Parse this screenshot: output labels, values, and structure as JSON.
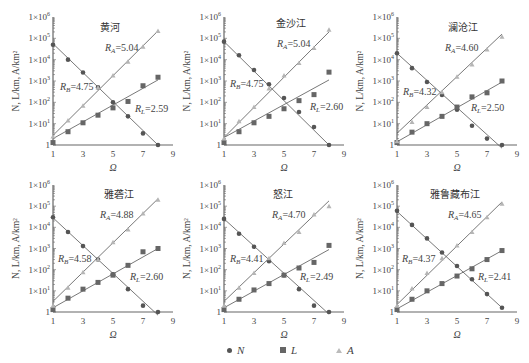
{
  "chart_data": [
    {
      "type": "scatter",
      "title": "黄河",
      "xlabel": "Ω",
      "ylabel": "N, L/km, A/km²",
      "x_ticks": [
        "1",
        "3",
        "5",
        "7",
        "9"
      ],
      "y_ticks": [
        "1",
        "1×10¹",
        "1×10²",
        "1×10³",
        "1×10⁴",
        "1×10⁵",
        "1×10⁶"
      ],
      "xlim": [
        1,
        9
      ],
      "ylim": [
        1,
        1000000
      ],
      "yscale": "log",
      "x": [
        1,
        2,
        3,
        4,
        5,
        6,
        7,
        8
      ],
      "series": [
        {
          "name": "N",
          "marker": "circle",
          "values": [
            50000,
            10000,
            2500,
            500,
            100,
            22,
            3.5,
            1
          ]
        },
        {
          "name": "L",
          "marker": "square",
          "values": [
            1.3,
            4.2,
            11,
            25,
            55,
            110,
            600,
            1500
          ]
        },
        {
          "name": "A",
          "marker": "triangle",
          "values": [
            2.5,
            14,
            70,
            500,
            1800,
            8000,
            40000,
            220000
          ]
        }
      ],
      "annotations": [
        {
          "text": "R_A=5.04",
          "sym": "A",
          "val": "=5.04"
        },
        {
          "text": "R_B=4.75",
          "sym": "B",
          "val": "=4.75"
        },
        {
          "text": "R_L=2.59",
          "sym": "L",
          "val": "=2.59"
        }
      ],
      "fits": {
        "N": [
          4.75,
          0.0
        ],
        "L": [
          0.3,
          3.05
        ],
        "A": [
          0.45,
          5.35
        ]
      },
      "labelpos": {
        "title": [
          100,
          31
        ],
        "RA": [
          105,
          51
        ],
        "RB": [
          60,
          90
        ],
        "RL": [
          135,
          112
        ]
      }
    },
    {
      "type": "scatter",
      "title": "金沙江",
      "xlabel": "Ω",
      "ylabel": "N, L/km, A/km²",
      "x_ticks": [
        "1",
        "3",
        "5",
        "7",
        "9"
      ],
      "y_ticks": [
        "1",
        "1×10¹",
        "1×10²",
        "1×10³",
        "1×10⁴",
        "1×10⁵",
        "1×10⁶"
      ],
      "xlim": [
        1,
        9
      ],
      "ylim": [
        1,
        1000000
      ],
      "yscale": "log",
      "x": [
        1,
        2,
        3,
        4,
        5,
        6,
        7,
        8
      ],
      "series": [
        {
          "name": "N",
          "marker": "circle",
          "values": [
            70000,
            16000,
            3300,
            700,
            160,
            35,
            7,
            1
          ]
        },
        {
          "name": "L",
          "marker": "square",
          "values": [
            1.3,
            4.2,
            11,
            22,
            50,
            120,
            230,
            2600
          ]
        },
        {
          "name": "A",
          "marker": "triangle",
          "values": [
            2,
            13,
            60,
            450,
            1800,
            7000,
            35000,
            250000
          ]
        }
      ],
      "annotations": [
        {
          "text": "R_A=5.04",
          "sym": "A",
          "val": "=5.04"
        },
        {
          "text": "R_B=4.75",
          "sym": "B",
          "val": "=4.75"
        },
        {
          "text": "R_L=2.60",
          "sym": "L",
          "val": "=2.60"
        }
      ],
      "fits": {
        "N": [
          4.85,
          0.0
        ],
        "L": [
          0.35,
          3.05
        ],
        "A": [
          0.35,
          5.3
        ]
      },
      "labelpos": {
        "title": [
          276,
          27
        ],
        "RA": [
          277,
          47
        ],
        "RB": [
          230,
          87
        ],
        "RL": [
          310,
          110
        ]
      }
    },
    {
      "type": "scatter",
      "title": "澜沧江",
      "xlabel": "Ω",
      "ylabel": "N, L/km, A/km²",
      "x_ticks": [
        "1",
        "3",
        "5",
        "7",
        "9"
      ],
      "y_ticks": [
        "1",
        "1×10¹",
        "1×10²",
        "1×10³",
        "1×10⁴",
        "1×10⁵",
        "1×10⁶"
      ],
      "xlim": [
        1,
        9
      ],
      "ylim": [
        1,
        1000000
      ],
      "yscale": "log",
      "x": [
        1,
        2,
        3,
        4,
        5,
        6,
        7,
        8
      ],
      "series": [
        {
          "name": "N",
          "marker": "circle",
          "values": [
            20000,
            4000,
            900,
            220,
            45,
            8,
            2,
            1
          ]
        },
        {
          "name": "L",
          "marker": "square",
          "values": [
            1.3,
            4,
            10,
            22,
            60,
            180,
            280,
            1000
          ]
        },
        {
          "name": "A",
          "marker": "triangle",
          "values": [
            1.5,
            12,
            60,
            300,
            1600,
            6000,
            30000,
            120000
          ]
        }
      ],
      "annotations": [
        {
          "text": "R_A=4.60",
          "sym": "A",
          "val": "=4.60"
        },
        {
          "text": "R_B=4.32",
          "sym": "B",
          "val": "=4.32"
        },
        {
          "text": "R_L=2.50",
          "sym": "L",
          "val": "=2.50"
        }
      ],
      "fits": {
        "N": [
          4.3,
          -0.15
        ],
        "L": [
          0.15,
          2.95
        ],
        "A": [
          0.55,
          5.2
        ]
      },
      "labelpos": {
        "title": [
          448,
          31
        ],
        "RA": [
          445,
          51
        ],
        "RB": [
          403,
          95
        ],
        "RL": [
          471,
          111
        ]
      }
    },
    {
      "type": "scatter",
      "title": "雅砻江",
      "xlabel": "Ω",
      "ylabel": "N, L/km, A/km²",
      "x_ticks": [
        "1",
        "3",
        "5",
        "7",
        "9"
      ],
      "y_ticks": [
        "1",
        "1×10¹",
        "1×10²",
        "1×10³",
        "1×10⁴",
        "1×10⁵",
        "1×10⁶"
      ],
      "xlim": [
        1,
        9
      ],
      "ylim": [
        1,
        1000000
      ],
      "yscale": "log",
      "x": [
        1,
        2,
        3,
        4,
        5,
        6,
        7,
        8
      ],
      "series": [
        {
          "name": "N",
          "marker": "circle",
          "values": [
            30000,
            6000,
            1300,
            300,
            60,
            12,
            2,
            1
          ]
        },
        {
          "name": "L",
          "marker": "square",
          "values": [
            1.3,
            4.5,
            12,
            25,
            55,
            160,
            700,
            1000
          ]
        },
        {
          "name": "A",
          "marker": "triangle",
          "values": [
            2,
            14,
            75,
            300,
            2000,
            8000,
            45000,
            200000
          ]
        }
      ],
      "annotations": [
        {
          "text": "R_A=4.88",
          "sym": "A",
          "val": "=4.88"
        },
        {
          "text": "R_B=4.58",
          "sym": "B",
          "val": "=4.58"
        },
        {
          "text": "R_L=2.60",
          "sym": "L",
          "val": "=2.60"
        }
      ],
      "fits": {
        "N": [
          4.45,
          -0.15
        ],
        "L": [
          0.2,
          3.0
        ],
        "A": [
          0.5,
          5.35
        ]
      },
      "labelpos": {
        "title": [
          104,
          198
        ],
        "RA": [
          100,
          218
        ],
        "RB": [
          58,
          262
        ],
        "RL": [
          130,
          280
        ]
      }
    },
    {
      "type": "scatter",
      "title": "怒江",
      "xlabel": "Ω",
      "ylabel": "N, L/km, A/km²",
      "x_ticks": [
        "1",
        "3",
        "5",
        "7",
        "9"
      ],
      "y_ticks": [
        "1",
        "1×10¹",
        "1×10²",
        "1×10³",
        "1×10⁴",
        "1×10⁵",
        "1×10⁶"
      ],
      "xlim": [
        1,
        9
      ],
      "ylim": [
        1,
        1000000
      ],
      "yscale": "log",
      "x": [
        1,
        2,
        3,
        4,
        5,
        6,
        7,
        8
      ],
      "series": [
        {
          "name": "N",
          "marker": "circle",
          "values": [
            25000,
            5000,
            1200,
            250,
            55,
            12,
            2,
            1
          ]
        },
        {
          "name": "L",
          "marker": "square",
          "values": [
            1.3,
            4,
            11,
            22,
            55,
            120,
            220,
            1400
          ]
        },
        {
          "name": "A",
          "marker": "triangle",
          "values": [
            2,
            14,
            70,
            350,
            1800,
            6000,
            40000,
            100000
          ]
        }
      ],
      "annotations": [
        {
          "text": "R_A=4.70",
          "sym": "A",
          "val": "=4.70"
        },
        {
          "text": "R_B=4.41",
          "sym": "B",
          "val": "=4.41"
        },
        {
          "text": "R_L=2.49",
          "sym": "L",
          "val": "=2.49"
        }
      ],
      "fits": {
        "N": [
          4.4,
          -0.1
        ],
        "L": [
          0.2,
          2.95
        ],
        "A": [
          0.5,
          5.25
        ]
      },
      "labelpos": {
        "title": [
          273,
          198
        ],
        "RA": [
          272,
          218
        ],
        "RB": [
          230,
          262
        ],
        "RL": [
          300,
          280
        ]
      }
    },
    {
      "type": "scatter",
      "title": "雅鲁藏布江",
      "xlabel": "Ω",
      "ylabel": "N, L/km, A/km²",
      "x_ticks": [
        "1",
        "3",
        "5",
        "7",
        "9"
      ],
      "y_ticks": [
        "1",
        "1×10¹",
        "1×10²",
        "1×10³",
        "1×10⁴",
        "1×10⁵",
        "1×10⁶"
      ],
      "xlim": [
        1,
        9
      ],
      "ylim": [
        1,
        1000000
      ],
      "yscale": "log",
      "x": [
        1,
        2,
        3,
        4,
        5,
        6,
        7,
        8
      ],
      "series": [
        {
          "name": "N",
          "marker": "circle",
          "values": [
            60000,
            13000,
            3000,
            650,
            150,
            35,
            7,
            1.6
          ]
        },
        {
          "name": "L",
          "marker": "square",
          "values": [
            1.3,
            4,
            10,
            22,
            50,
            110,
            300,
            800
          ]
        },
        {
          "name": "A",
          "marker": "triangle",
          "values": [
            2,
            13,
            70,
            350,
            1400,
            6000,
            30000,
            130000
          ]
        }
      ],
      "annotations": [
        {
          "text": "R_A=4.65",
          "sym": "A",
          "val": "=4.65"
        },
        {
          "text": "R_B=4.37",
          "sym": "B",
          "val": "=4.37"
        },
        {
          "text": "R_L=2.41",
          "sym": "L",
          "val": "=2.41"
        }
      ],
      "fits": {
        "N": [
          4.75,
          0.2
        ],
        "L": [
          0.15,
          2.9
        ],
        "A": [
          0.35,
          5.2
        ]
      },
      "labelpos": {
        "title": [
          430,
          198
        ],
        "RA": [
          448,
          218
        ],
        "RB": [
          402,
          262
        ],
        "RL": [
          478,
          280
        ]
      }
    }
  ],
  "legend": {
    "items": [
      {
        "label": "N",
        "marker": "circle"
      },
      {
        "label": "L",
        "marker": "square"
      },
      {
        "label": "A",
        "marker": "triangle"
      }
    ],
    "position": "bottom"
  },
  "layout": {
    "axis_x": [
      53,
      224,
      397
    ],
    "x_unit": 15.0,
    "rows": [
      {
        "y0": 145,
        "y6": 17
      },
      {
        "y0": 312,
        "y6": 185
      }
    ],
    "colors": {
      "N": "#555555",
      "L": "#666666",
      "A": "#b5b5b5",
      "axis": "#666666",
      "line": "#555555"
    }
  }
}
